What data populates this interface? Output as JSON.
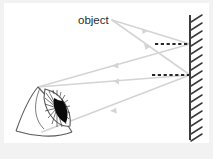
{
  "diagram": {
    "background_color": "#f2f2f2",
    "canvas_color": "#ffffff",
    "labels": {
      "object": "object"
    },
    "colors": {
      "ray": "#d0d0d0",
      "mirror": "#3a3a3a",
      "hatch": "#3a3a3a",
      "dashed_virtual": "#262626",
      "eye_outline": "#4a4a4a",
      "pupil": "#000000",
      "text": "#2b2b2b"
    },
    "mirror": {
      "x": 190,
      "y_top": 15,
      "y_bottom": 140,
      "hatch_count": 16,
      "hatch_length": 13,
      "hatch_angle_deg": -32
    },
    "object_point": {
      "x": 112,
      "y": 20
    },
    "eye_point": {
      "x": 38,
      "y": 87
    },
    "virtual_lines": [
      {
        "name": "upper-virtual-image-line",
        "x1": 155,
        "y1": 44,
        "x2": 190,
        "y2": 44
      },
      {
        "name": "lower-virtual-image-line",
        "x1": 152,
        "y1": 75,
        "x2": 190,
        "y2": 75
      }
    ],
    "rays": [
      {
        "name": "incident-ray-upper",
        "points": "112,20 190,44",
        "arrow_at": 0.55
      },
      {
        "name": "reflected-ray-upper",
        "points": "190,44 38,87",
        "arrow_at": 0.55
      },
      {
        "name": "incident-ray-lower",
        "points": "112,20 190,75",
        "arrow_at": 0.55
      },
      {
        "name": "reflected-ray-lower",
        "points": "190,75 38,87",
        "arrow_at": 0.5
      }
    ],
    "eye": {
      "iris_spokes": 22,
      "description": "eye-in-perspective-with-iris-and-pupil"
    }
  }
}
